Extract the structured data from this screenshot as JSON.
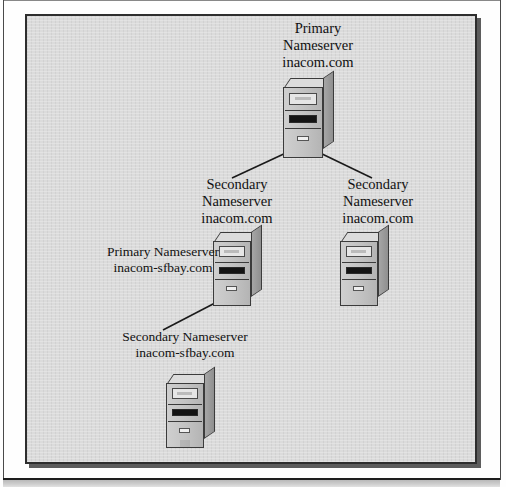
{
  "figure": {
    "kind": "dns-hierarchy-diagram",
    "background_color": "#d6d6d6",
    "border_color": "#2e2e2e",
    "page_background": "#ffffff"
  },
  "nodes": [
    {
      "id": "primary-root",
      "role": "Primary",
      "label_lines": [
        "Primary",
        "Nameserver",
        "inacom.com"
      ],
      "label_text": "Primary\nNameserver\ninacom.com",
      "domain": "inacom.com",
      "icon": "server-tower-icon"
    },
    {
      "id": "secondary-left",
      "role": "Secondary",
      "label_lines": [
        "Secondary",
        "Nameserver",
        "inacom.com"
      ],
      "label_text": "Secondary\nNameserver\ninacom.com",
      "domain": "inacom.com",
      "icon": "server-tower-icon"
    },
    {
      "id": "secondary-right",
      "role": "Secondary",
      "label_lines": [
        "Secondary",
        "Nameserver",
        "inacom.com"
      ],
      "label_text": "Secondary\nNameserver\ninacom.com",
      "domain": "inacom.com",
      "icon": "server-tower-icon"
    },
    {
      "id": "primary-sfbay",
      "role": "Primary",
      "label_lines": [
        "Primary Nameserver",
        "inacom-sfbay.com"
      ],
      "label_text": "Primary Nameserver\ninacom-sfbay.com",
      "domain": "inacom-sfbay.com",
      "icon": "server-tower-icon"
    },
    {
      "id": "secondary-sfbay",
      "role": "Secondary",
      "label_lines": [
        "Secondary Nameserver",
        "inacom-sfbay.com"
      ],
      "label_text": "Secondary Nameserver\ninacom-sfbay.com",
      "domain": "inacom-sfbay.com",
      "icon": "server-tower-icon"
    }
  ],
  "links": [
    {
      "from": "primary-root",
      "to": "secondary-left"
    },
    {
      "from": "primary-root",
      "to": "secondary-right"
    },
    {
      "from": "primary-sfbay",
      "to": "secondary-sfbay"
    }
  ]
}
